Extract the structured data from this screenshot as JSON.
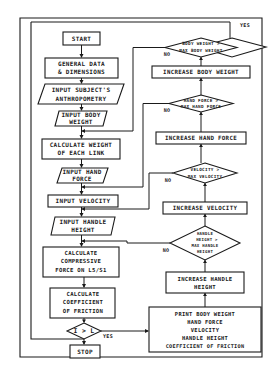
{
  "diagram": {
    "type": "flowchart",
    "nodes": {
      "start": {
        "label": "START",
        "shape": "terminal"
      },
      "general_data": {
        "lines": [
          "GENERAL DATA",
          "& DIMENSIONS"
        ],
        "shape": "process"
      },
      "input_anthro": {
        "lines": [
          "INPUT SUBJECT'S",
          "ANTHROPOMETRY"
        ],
        "shape": "io"
      },
      "input_body_weight": {
        "lines": [
          "INPUT BODY",
          "WEIGHT"
        ],
        "shape": "io"
      },
      "calc_link_weight": {
        "lines": [
          "CALCULATE WEIGHT",
          "OF EACH LINK"
        ],
        "shape": "process"
      },
      "input_hand_force": {
        "lines": [
          "INPUT HAND",
          "FORCE"
        ],
        "shape": "io"
      },
      "input_velocity": {
        "lines": [
          "INPUT VELOCITY"
        ],
        "shape": "process"
      },
      "input_handle_height": {
        "lines": [
          "INPUT HANDLE",
          "HEIGHT"
        ],
        "shape": "io"
      },
      "calc_compressive": {
        "lines": [
          "CALCULATE",
          "COMPRESSIVE",
          "FORCE ON L5/S1"
        ],
        "shape": "process"
      },
      "calc_friction": {
        "lines": [
          "CALCULATE",
          "COEFFICIENT",
          "OF FRICTION"
        ],
        "shape": "process"
      },
      "decision_i_l": {
        "label": "I > L",
        "shape": "decision"
      },
      "stop": {
        "label": "STOP",
        "shape": "terminal"
      },
      "decision_body_weight": {
        "lines": [
          "BODY WEIGHT >",
          "MAX BODY WEIGHT"
        ],
        "shape": "decision"
      },
      "increase_body_weight": {
        "lines": [
          "INCREASE BODY WEIGHT"
        ],
        "shape": "process"
      },
      "decision_hand_force": {
        "lines": [
          "HAND FORCE >",
          "MAX HAND FORCE"
        ],
        "shape": "decision"
      },
      "increase_hand_force": {
        "lines": [
          "INCREASE HAND FORCE"
        ],
        "shape": "process"
      },
      "decision_velocity": {
        "lines": [
          "VELOCITY >",
          "MAX VELOCITY"
        ],
        "shape": "decision"
      },
      "increase_velocity": {
        "lines": [
          "INCREASE VELOCITY"
        ],
        "shape": "process"
      },
      "decision_handle_height": {
        "lines": [
          "HANDLE",
          "HEIGHT >",
          "MAX HANDLE",
          "HEIGHT"
        ],
        "shape": "decision"
      },
      "increase_handle_height": {
        "lines": [
          "INCREASE HANDLE",
          "HEIGHT"
        ],
        "shape": "process"
      },
      "print_results": {
        "lines": [
          "PRINT BODY WEIGHT",
          "HAND FORCE",
          "VELOCITY",
          "HANDLE HEIGHT",
          "COEFFICIENT OF FRICTION"
        ],
        "shape": "process"
      }
    },
    "edge_labels": {
      "yes": "YES",
      "no": "NO"
    }
  }
}
